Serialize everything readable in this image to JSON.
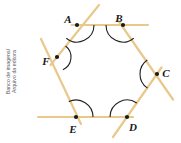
{
  "figure": {
    "credit_line_1": "Banco de imagens/",
    "credit_line_2": "Arquivo da editora",
    "colors": {
      "side": "#E9C98B",
      "vertex_dot": "#1a1a1a",
      "arc": "#231f20",
      "label": "#1a1a1a",
      "background": "#ffffff",
      "credit_text": "#58585a"
    },
    "stroke_width_side": 2.2,
    "stroke_width_arc": 1.1,
    "vertex_dot_radius": 2.1,
    "vertices": [
      {
        "id": "A",
        "label": "A",
        "x": 77,
        "y": 25,
        "label_x": 68,
        "label_y": 20
      },
      {
        "id": "B",
        "label": "B",
        "x": 123,
        "y": 25,
        "label_x": 119,
        "label_y": 19
      },
      {
        "id": "C",
        "label": "C",
        "x": 157,
        "y": 74,
        "label_x": 166,
        "label_y": 74
      },
      {
        "id": "D",
        "label": "D",
        "x": 127,
        "y": 117,
        "label_x": 133,
        "label_y": 128
      },
      {
        "id": "E",
        "label": "E",
        "x": 76,
        "y": 117,
        "label_x": 73,
        "label_y": 130
      },
      {
        "id": "F",
        "label": "F",
        "x": 57,
        "y": 57,
        "label_x": 46,
        "label_y": 62
      }
    ],
    "sides": [
      {
        "name": "side-AB",
        "from": "A",
        "to": "B",
        "x1": 71.5,
        "y1": 25.0,
        "x2": 148.0,
        "y2": 25.0
      },
      {
        "name": "side-BC",
        "from": "B",
        "to": "C",
        "x1": 118.5,
        "y1": 21.0,
        "x2": 173.0,
        "y2": 99.5
      },
      {
        "name": "side-CD",
        "from": "C",
        "to": "D",
        "x1": 161.5,
        "y1": 67.5,
        "x2": 113.0,
        "y2": 137.0
      },
      {
        "name": "side-DE",
        "from": "D",
        "to": "E",
        "x1": 133.0,
        "y1": 117.0,
        "x2": 38.0,
        "y2": 117.0
      },
      {
        "name": "side-EF",
        "from": "E",
        "to": "F",
        "x1": 81.0,
        "y1": 124.0,
        "x2": 41.0,
        "y2": 39.0
      },
      {
        "name": "side-FA",
        "from": "F",
        "to": "A",
        "x1": 50.5,
        "y1": 65.0,
        "x2": 99.0,
        "y2": 5.0
      }
    ],
    "angle_arcs": [
      {
        "name": "arc-A",
        "at": "A",
        "radius": 17,
        "start_deg": 0,
        "end_deg": 129
      },
      {
        "name": "arc-B",
        "at": "B",
        "radius": 17,
        "start_deg": 51,
        "end_deg": 180
      },
      {
        "name": "arc-C",
        "at": "C",
        "radius": 17,
        "start_deg": 124,
        "end_deg": 235
      },
      {
        "name": "arc-D",
        "at": "D",
        "radius": 17,
        "start_deg": 180,
        "end_deg": 305
      },
      {
        "name": "arc-E",
        "at": "E",
        "radius": 17,
        "start_deg": 245,
        "end_deg": 360
      },
      {
        "name": "arc-F",
        "at": "F",
        "radius": 14,
        "start_deg": 308,
        "end_deg": 65
      }
    ]
  }
}
